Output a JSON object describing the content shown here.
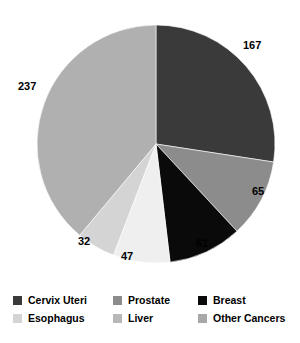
{
  "chart_data": {
    "type": "pie",
    "title": "",
    "subtitle": "",
    "xlabel": "",
    "ylabel": "",
    "grid": false,
    "legend_position": "bottom",
    "start_angle_deg": 0,
    "direction": "clockwise",
    "total": 609,
    "categories": [
      "Cervix Uteri",
      "Prostate",
      "Breast",
      "Liver",
      "Esophagus",
      "Other Cancers"
    ],
    "values": [
      167,
      65,
      61,
      47,
      32,
      237
    ],
    "colors": [
      "#3a3a3a",
      "#8c8c8c",
      "#0a0a0a",
      "#efefef",
      "#d4d4d4",
      "#b0b0b0"
    ],
    "slices": [
      {
        "label": "Cervix Uteri",
        "value": 167,
        "value_text": "167",
        "color": "#3a3a3a",
        "label_x": 243,
        "label_y": 40
      },
      {
        "label": "Prostate",
        "value": 65,
        "value_text": "65",
        "color": "#8c8c8c",
        "label_x": 252,
        "label_y": 186
      },
      {
        "label": "Breast",
        "value": 61,
        "value_text": "61",
        "color": "#0a0a0a",
        "label_x": 196,
        "label_y": 238
      },
      {
        "label": "Liver",
        "value": 47,
        "value_text": "47",
        "color": "#efefef",
        "label_x": 121,
        "label_y": 251
      },
      {
        "label": "Esophagus",
        "value": 32,
        "value_text": "32",
        "color": "#d4d4d4",
        "label_x": 78,
        "label_y": 236
      },
      {
        "label": "Other Cancers",
        "value": 237,
        "value_text": "237",
        "color": "#b0b0b0",
        "label_x": 18,
        "label_y": 81
      }
    ],
    "geometry": {
      "center_x": 156,
      "center_y": 144,
      "radius": 119
    }
  },
  "legend": {
    "entries": [
      {
        "label": "Cervix Uteri",
        "color": "#3a3a3a"
      },
      {
        "label": "Prostate",
        "color": "#8c8c8c"
      },
      {
        "label": "Breast",
        "color": "#0a0a0a"
      },
      {
        "label": "Esophagus",
        "color": "#d4d4d4"
      },
      {
        "label": "Liver",
        "color": "#b8b8b8"
      },
      {
        "label": "Other Cancers",
        "color": "#a8a8a8"
      }
    ]
  }
}
